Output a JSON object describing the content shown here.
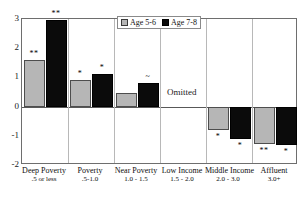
{
  "chart_data": {
    "type": "bar",
    "title": "",
    "subtitle": "",
    "xlabel": "",
    "ylabel": "",
    "ylim": [
      -2,
      3
    ],
    "yticks": [
      3,
      2,
      1,
      0,
      -1,
      -2
    ],
    "ytick_labels": [
      "3",
      "2",
      "1",
      "0",
      "-1",
      "-2"
    ],
    "grid": false,
    "legend_position": "top-center",
    "categories": [
      "Deep Poverty",
      "Poverty",
      "Near Poverty",
      "Low Income",
      "Middle Income",
      "Affluent"
    ],
    "category_ranges": [
      ".5 or less",
      ".5-1.0",
      "1.0 - 1.5",
      "1.5 - 2.0",
      "2.0 - 3.0",
      "3.0+"
    ],
    "series": [
      {
        "name": "Age 5-6",
        "color": "#b6b6b6",
        "values": [
          1.6,
          0.9,
          0.45,
          null,
          -0.8,
          -1.28
        ],
        "annotations": [
          "**",
          "*",
          "",
          "",
          "*",
          "**"
        ]
      },
      {
        "name": "Age 7-8",
        "color": "#0b0b0b",
        "values": [
          2.95,
          1.1,
          0.82,
          null,
          -1.1,
          -1.3
        ],
        "annotations": [
          "**",
          "*",
          "~",
          "",
          "*",
          "*"
        ]
      }
    ],
    "omitted_label": "Omitted",
    "omitted_category": "Low Income"
  },
  "legend": {
    "items": [
      {
        "label": "Age 5-6",
        "swatch": "light"
      },
      {
        "label": "Age 7-8",
        "swatch": "dark"
      }
    ]
  },
  "axis": {
    "y_labels": [
      "3",
      "2",
      "1",
      "0",
      "-1",
      "-2"
    ]
  },
  "colors": {
    "age_5_6": "#b6b6b6",
    "age_7_8": "#0b0b0b",
    "frame": "#6e6e6e",
    "divider": "#b8b8b8",
    "zero_line": "#585858",
    "background": "#ffffff"
  }
}
